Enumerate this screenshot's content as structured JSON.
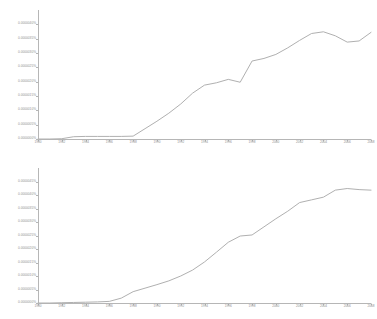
{
  "chart_data": [
    {
      "id": "top",
      "type": "line",
      "title": "",
      "xlabel": "",
      "ylabel": "",
      "grid": false,
      "legend": "none",
      "xlim": [
        1980,
        2008
      ],
      "ylim": [
        0,
        4.5e-06
      ],
      "xticks": [
        1980,
        1982,
        1984,
        1986,
        1988,
        1990,
        1992,
        1994,
        1996,
        1998,
        2000,
        2002,
        2004,
        2006,
        2008
      ],
      "xticklabels": [
        "1980",
        "1982",
        "1984",
        "1986",
        "1988",
        "1990",
        "1992",
        "1994",
        "1996",
        "1998",
        "2000",
        "2002",
        "2004",
        "2006",
        "2008"
      ],
      "yticks": [
        0,
        5e-07,
        1e-06,
        1.5e-06,
        2e-06,
        2.5e-06,
        3e-06,
        3.5e-06,
        4e-06
      ],
      "yticklabels": [
        "0.0000000%",
        "0.0000005%",
        "0.0000010%",
        "0.0000015%",
        "0.0000020%",
        "0.0000025%",
        "0.0000030%",
        "0.0000035%",
        "0.0000040%"
      ],
      "x": [
        1980,
        1981,
        1982,
        1983,
        1984,
        1985,
        1986,
        1987,
        1988,
        1989,
        1990,
        1991,
        1992,
        1993,
        1994,
        1995,
        1996,
        1997,
        1998,
        1999,
        2000,
        2001,
        2002,
        2003,
        2004,
        2005,
        2006,
        2007,
        2008
      ],
      "values": [
        0.0,
        0.0,
        1e-08,
        8e-08,
        9e-08,
        9e-08,
        9e-08,
        9e-08,
        1e-07,
        3.6e-07,
        6.2e-07,
        9e-07,
        1.22e-06,
        1.6e-06,
        1.88e-06,
        1.96e-06,
        2.08e-06,
        1.98e-06,
        2.72e-06,
        2.81e-06,
        2.95e-06,
        3.18e-06,
        3.44e-06,
        3.68e-06,
        3.74e-06,
        3.6e-06,
        3.38e-06,
        3.42e-06,
        3.72e-06
      ]
    },
    {
      "id": "bottom",
      "type": "line",
      "title": "",
      "xlabel": "",
      "ylabel": "",
      "grid": false,
      "legend": "none",
      "xlim": [
        1980,
        2008
      ],
      "ylim": [
        0,
        5e-06
      ],
      "xticks": [
        1980,
        1982,
        1984,
        1986,
        1988,
        1990,
        1992,
        1994,
        1996,
        1998,
        2000,
        2002,
        2004,
        2006,
        2008
      ],
      "xticklabels": [
        "1980",
        "1982",
        "1984",
        "1986",
        "1988",
        "1990",
        "1992",
        "1994",
        "1996",
        "1998",
        "2000",
        "2002",
        "2004",
        "2006",
        "2008"
      ],
      "yticks": [
        0,
        5e-07,
        1e-06,
        1.5e-06,
        2e-06,
        2.5e-06,
        3e-06,
        3.5e-06,
        4e-06,
        4.5e-06
      ],
      "yticklabels": [
        "0.0000000%",
        "0.0000005%",
        "0.0000010%",
        "0.0000015%",
        "0.0000020%",
        "0.0000025%",
        "0.0000030%",
        "0.0000035%",
        "0.0000040%",
        "0.0000045%"
      ],
      "x": [
        1980,
        1981,
        1982,
        1983,
        1984,
        1985,
        1986,
        1987,
        1988,
        1989,
        1990,
        1991,
        1992,
        1993,
        1994,
        1995,
        1996,
        1997,
        1998,
        1999,
        2000,
        2001,
        2002,
        2003,
        2004,
        2005,
        2006,
        2007,
        2008
      ],
      "values": [
        0.0,
        0.0,
        1e-08,
        2e-08,
        3e-08,
        4e-08,
        6e-08,
        1.8e-07,
        4.2e-07,
        5.5e-07,
        6.8e-07,
        8.2e-07,
        1e-06,
        1.22e-06,
        1.52e-06,
        1.88e-06,
        2.25e-06,
        2.48e-06,
        2.52e-06,
        2.82e-06,
        3.12e-06,
        3.4e-06,
        3.72e-06,
        3.82e-06,
        3.92e-06,
        4.18e-06,
        4.24e-06,
        4.2e-06,
        4.18e-06
      ]
    }
  ],
  "style": {
    "line_color": "#b0b0b0",
    "axis_color": "#b6b6b6",
    "label_color": "#909090",
    "background": "#ffffff"
  }
}
